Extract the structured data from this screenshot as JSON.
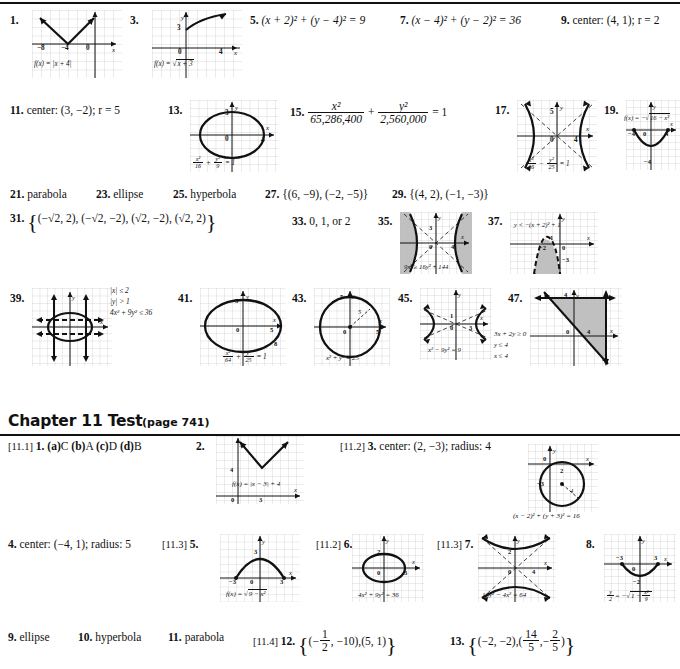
{
  "page": {
    "width": 680,
    "height": 669,
    "background": "#ffffff",
    "ink": "#111111",
    "shade": "#b8b8b8"
  },
  "review_answers": [
    {
      "n": "1.",
      "type": "graph",
      "equation": "f(x) = |x + 4|",
      "ticks": [
        "-8",
        "-4",
        "0"
      ]
    },
    {
      "n": "3.",
      "type": "graph",
      "equation": "f(x) = √x + 3",
      "ticks": [
        "3",
        "0",
        "4"
      ]
    },
    {
      "n": "5.",
      "type": "text",
      "answer": "(x + 2)² + (y − 4)² = 9"
    },
    {
      "n": "7.",
      "type": "text",
      "answer": "(x − 4)² + (y − 2)² = 36"
    },
    {
      "n": "9.",
      "type": "text",
      "answer": "center: (4, 1); r = 2"
    },
    {
      "n": "11.",
      "type": "text",
      "answer": "center: (3, −2); r = 5"
    },
    {
      "n": "13.",
      "type": "graph",
      "equation": "x²/16 + y²/9 = 1",
      "ticks": [
        "3",
        "0",
        "4"
      ]
    },
    {
      "n": "15.",
      "type": "text",
      "answer": "x²/65,286,400 + y²/2,560,000 = 1",
      "num1": "x²",
      "den1": "65,286,400",
      "num2": "y²",
      "den2": "2,560,000",
      "rhs": "= 1"
    },
    {
      "n": "17.",
      "type": "graph",
      "equation": "x²/16 − y²/25 = 1",
      "ticks": [
        "5",
        "0",
        "4"
      ]
    },
    {
      "n": "19.",
      "type": "graph",
      "equation": "f(x) = −√(16 − x²)",
      "ticks": [
        "-4",
        "0",
        "4"
      ]
    },
    {
      "n": "21.",
      "type": "text",
      "answer": "parabola"
    },
    {
      "n": "23.",
      "type": "text",
      "answer": "ellipse"
    },
    {
      "n": "25.",
      "type": "text",
      "answer": "hyperbola"
    },
    {
      "n": "27.",
      "type": "text",
      "answer": "{(6, −9), (−2, −5)}"
    },
    {
      "n": "29.",
      "type": "text",
      "answer": "{(4, 2), (−1, −3)}"
    },
    {
      "n": "31.",
      "type": "text",
      "answer": "{(−√2, 2), (−√2, −2), (√2, −2), (√2, 2)}"
    },
    {
      "n": "33.",
      "type": "text",
      "answer": "0, 1, or 2"
    },
    {
      "n": "35.",
      "type": "graph",
      "equation": "9x² ≥ 16y² + 144",
      "ticks": [
        "3",
        "0",
        "4"
      ]
    },
    {
      "n": "37.",
      "type": "graph",
      "equation": "y < −(x + 2)² + 1",
      "ticks": [
        "1",
        "-2",
        "0",
        "-3"
      ]
    },
    {
      "n": "39.",
      "type": "graph",
      "equation": "|x| ≤ 2 ; |y| > 1 ; 4x² + 9y² ≤ 36",
      "ticks": []
    },
    {
      "n": "41.",
      "type": "graph",
      "equation": "x²/64 + y²/25 = 1",
      "ticks": [
        "5",
        "0",
        "8"
      ]
    },
    {
      "n": "43.",
      "type": "graph",
      "equation": "x² + y² = 25",
      "ticks": [
        "5",
        "0",
        "5"
      ]
    },
    {
      "n": "45.",
      "type": "graph",
      "equation": "x² − 9y² = 9",
      "ticks": [
        "1",
        "0",
        "3"
      ]
    },
    {
      "n": "47.",
      "type": "graph",
      "equation": "3x + 2y ≥ 0 ; y ≤ 4 ; x ≤ 4",
      "ticks": [
        "4",
        "0",
        "4"
      ]
    }
  ],
  "review_labels": {
    "g1_eq": "f(x) = |x + 4|",
    "g1_t1": "−8",
    "g1_t2": "−4",
    "g1_t3": "0",
    "g1_t4": "4",
    "g3_eq_pre": "f(x) = ",
    "g3_eq_rad": "x + 3",
    "g3_t1": "3",
    "g3_t2": "0",
    "g3_t3": "4",
    "g13_t1": "3",
    "g13_t2": "0",
    "g13_t3": "4",
    "g13_f1n": "x²",
    "g13_f1d": "16",
    "g13_f2n": "y²",
    "g13_f2d": "9",
    "g13_rhs": "= 1",
    "g17_t1": "5",
    "g17_t2": "0",
    "g17_t3": "4",
    "g17_f1n": "x²",
    "g17_f1d": "16",
    "g17_f2n": "y²",
    "g17_f2d": "25",
    "g17_rhs": "= 1",
    "g19_eq_pre": "f(x) = −",
    "g19_eq_rad": "16 − x²",
    "g19_t1": "−4",
    "g19_t2": "0",
    "g19_t3": "4",
    "g19_t4": "−4",
    "g35_eq": "9x² ≥ 16y² + 144",
    "g35_t1": "3",
    "g35_t2": "0",
    "g35_t3": "4",
    "g37_eq": "y < −(x + 2)² + 1",
    "g37_t1": "1",
    "g37_t2": "−2",
    "g37_t3": "0",
    "g37_t4": "−3",
    "g39_c1": "|x| ≤ 2",
    "g39_c2": "|y| > 1",
    "g39_c3": "4x² + 9y² ≤ 36",
    "g41_t1": "5",
    "g41_t2": "0",
    "g41_t3": "5",
    "g41_t4": "8",
    "g41_f1n": "x²",
    "g41_f1d": "64",
    "g41_f2n": "y²",
    "g41_f2d": "25",
    "g41_rhs": "= 1",
    "g43_t1": "5",
    "g43_t2": "5",
    "g43_t3": "0",
    "g43_t4": "5",
    "g43_t5": "5",
    "g43_eq": "x² + y² = 25",
    "g45_t1": "1",
    "g45_t2": "0",
    "g45_t3": "3",
    "g45_eq": "x² − 9y² = 9",
    "g47_t1": "4",
    "g47_t2": "0",
    "g47_t3": "4",
    "g47_c1": "3x + 2y ≥ 0",
    "g47_c2": "y ≤ 4",
    "g47_c3": "x ≤ 4"
  },
  "chapter_test": {
    "title": "Chapter 11 Test",
    "page_ref": "(page 741)",
    "answers": [
      {
        "sec": "[11.1]",
        "n": "1.",
        "type": "text",
        "answer": "(a) C (b) A (c) D (d) B",
        "parts": [
          {
            "label": "(a)",
            "val": "C"
          },
          {
            "label": "(b)",
            "val": "A"
          },
          {
            "label": "(c)",
            "val": "D"
          },
          {
            "label": "(d)",
            "val": "B"
          }
        ]
      },
      {
        "sec": "",
        "n": "2.",
        "type": "graph",
        "equation": "f(x) = |x − 3| + 4",
        "ticks": [
          "4",
          "0",
          "3"
        ]
      },
      {
        "sec": "[11.2]",
        "n": "3.",
        "type": "text",
        "answer": "center: (2, −3); radius: 4",
        "graph_eq": "(x − 2)² + (y + 3)² = 16",
        "ticks": [
          "0",
          "2",
          "−3",
          "4"
        ]
      },
      {
        "sec": "",
        "n": "4.",
        "type": "text",
        "answer": "center: (−4, 1); radius: 5"
      },
      {
        "sec": "[11.3]",
        "n": "5.",
        "type": "graph",
        "equation": "f(x) = √(9 − x²)",
        "ticks": [
          "3",
          "−3",
          "0",
          "3"
        ]
      },
      {
        "sec": "[11.2]",
        "n": "6.",
        "type": "graph",
        "equation": "4x² + 9y² = 36",
        "ticks": [
          "2",
          "0",
          "3"
        ]
      },
      {
        "sec": "[11.3]",
        "n": "7.",
        "type": "graph",
        "equation": "16y² − 4x² = 64",
        "ticks": [
          "2",
          "0",
          "4"
        ]
      },
      {
        "sec": "",
        "n": "8.",
        "type": "graph",
        "equation": "y/2 = −√(1 − x²/9)",
        "ticks": [
          "−3",
          "3",
          "0",
          "−2"
        ]
      },
      {
        "sec": "",
        "n": "9.",
        "type": "text",
        "answer": "ellipse"
      },
      {
        "sec": "",
        "n": "10.",
        "type": "text",
        "answer": "hyperbola"
      },
      {
        "sec": "",
        "n": "11.",
        "type": "text",
        "answer": "parabola"
      },
      {
        "sec": "[11.4]",
        "n": "12.",
        "type": "text",
        "answer": "{(−1/2, −10), (5, 1)}"
      },
      {
        "sec": "",
        "n": "13.",
        "type": "text",
        "answer": "{(−2, −2), (14/5, −2/5)}"
      }
    ],
    "labels": {
      "t2_eq": "f(x) = |x − 3| + 4",
      "t2_t1": "4",
      "t2_t2": "0",
      "t2_t3": "3",
      "t3_eq": "(x − 2)² + (y + 3)² = 16",
      "t3_t1": "0",
      "t3_t2": "2",
      "t3_t3": "−3",
      "t3_t4": "4",
      "t5_eq_pre": "f(x) = ",
      "t5_eq_rad": "9 − x²",
      "t5_t1": "3",
      "t5_t2": "−3",
      "t5_t3": "0",
      "t5_t4": "3",
      "t6_eq": "4x² + 9y² = 36",
      "t6_t1": "2",
      "t6_t2": "0",
      "t6_t3": "3",
      "t7_eq": "16y² − 4x² = 64",
      "t7_t1": "2",
      "t7_t2": "0",
      "t7_t3": "4",
      "t8_t1": "−3",
      "t8_t2": "3",
      "t8_t3": "0",
      "t8_t4": "−2",
      "t8_fn": "y",
      "t8_fd": "2",
      "t8_eq_mid": "= −",
      "t8_rad_n": "x²",
      "t8_rad_d": "9",
      "t8_rad_one": "1 −",
      "t12_n1": "1",
      "t12_d1": "2",
      "t12_rest": ", −10",
      "t12_pair2": "(5, 1)",
      "t13_pair1": "(−2, −2),",
      "t13_n1": "14",
      "t13_d1": "5",
      "t13_n2": "2",
      "t13_d2": "5"
    }
  },
  "sections": {
    "s21": "parabola",
    "s23": "ellipse",
    "s25": "hyperbola",
    "s27": "{(6, −9), (−2, −5)}",
    "s29": "{(4, 2), (−1, −3)}",
    "s33": "0, 1, or 2",
    "s31_a": "(−√2, 2),",
    "s31_b": "(−√2, −2),",
    "s31_c": "(√2, −2),",
    "s31_d": "(√2, 2)",
    "s5": "(x + 2)² + (y − 4)² = 9",
    "s7": "(x − 4)² + (y − 2)² = 36",
    "s9": "center: (4, 1); r = 2",
    "s11": "center: (3, −2); r = 5"
  },
  "numbers": {
    "n1": "1.",
    "n3": "3.",
    "n5": "5.",
    "n7": "7.",
    "n9": "9.",
    "n11": "11.",
    "n13": "13.",
    "n15": "15.",
    "n17": "17.",
    "n19": "19.",
    "n21": "21.",
    "n23": "23.",
    "n25": "25.",
    "n27": "27.",
    "n29": "29.",
    "n31": "31.",
    "n33": "33.",
    "n35": "35.",
    "n37": "37.",
    "n39": "39.",
    "n41": "41.",
    "n43": "43.",
    "n45": "45.",
    "n47": "47.",
    "t1": "1.",
    "t2": "2.",
    "t3": "3.",
    "t4": "4.",
    "t5": "5.",
    "t6": "6.",
    "t7": "7.",
    "t8": "8.",
    "t9": "9.",
    "t10": "10.",
    "t11": "11.",
    "t12": "12.",
    "t13": "13.",
    "sec111": "[11.1]",
    "sec112a": "[11.2]",
    "sec113a": "[11.3]",
    "sec112b": "[11.2]",
    "sec113b": "[11.3]",
    "sec114": "[11.4]",
    "pa": "(a)",
    "pb": "(b)",
    "pc": "(c)",
    "pd": "(d)",
    "va": "C",
    "vb": "A",
    "vc": "D",
    "vd": "B",
    "t9v": "ellipse",
    "t10v": "hyperbola",
    "t11v": "parabola",
    "t4v": "center: (−4, 1); radius: 5",
    "t3v": "center: (2, −3); radius: 4"
  }
}
